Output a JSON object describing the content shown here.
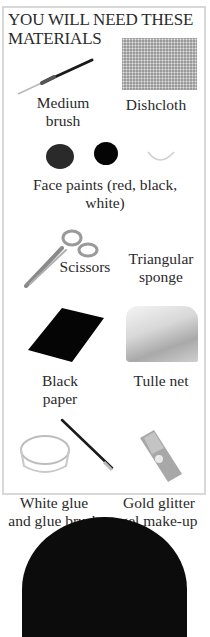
{
  "heading": {
    "line1": "YOU WILL NEED THESE",
    "line2": "MATERIALS"
  },
  "materials": [
    {
      "id": "medium-brush",
      "line1": "Medium",
      "line2": "brush",
      "icon": "paintbrush-icon"
    },
    {
      "id": "dishcloth",
      "line1": "Dishcloth",
      "line2": "",
      "icon": "dishcloth-icon"
    },
    {
      "id": "face-paints",
      "line1": "Face paints (red, black,",
      "line2": "white)",
      "icon": "face-paint-icon"
    },
    {
      "id": "scissors",
      "line1": "Scissors",
      "line2": "",
      "icon": "scissors-icon"
    },
    {
      "id": "triangular-sponge",
      "line1": "Triangular",
      "line2": "sponge",
      "icon": "sponge-icon"
    },
    {
      "id": "black-paper",
      "line1": "Black",
      "line2": "paper",
      "icon": "paper-icon"
    },
    {
      "id": "tulle-net",
      "line1": "Tulle net",
      "line2": "",
      "icon": "tulle-icon"
    },
    {
      "id": "white-glue",
      "line1": "White glue",
      "line2": "and glue brush",
      "icon": "glue-icon"
    },
    {
      "id": "gold-glitter",
      "line1": "Gold glitter",
      "line2": "gel make-up",
      "icon": "glitter-tube-icon"
    }
  ],
  "colors": {
    "border": "#d8d8d8",
    "paint_red": "#2a2a2a",
    "paint_black": "#050505",
    "paint_white": "#e6e6e6"
  }
}
